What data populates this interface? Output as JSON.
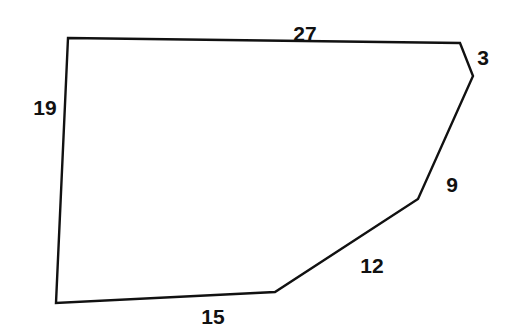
{
  "figure": {
    "name": "labeled-hexagon-perimeter-diagram",
    "background_color": "#ffffff",
    "stroke_color": "#111111",
    "stroke_width": 2.4,
    "fill": "none",
    "vertices": [
      {
        "name": "top-left",
        "x": 68,
        "y": 38
      },
      {
        "name": "top-right",
        "x": 460,
        "y": 43
      },
      {
        "name": "upper-right",
        "x": 473,
        "y": 76
      },
      {
        "name": "mid-right",
        "x": 418,
        "y": 199
      },
      {
        "name": "bottom-right",
        "x": 275,
        "y": 292
      },
      {
        "name": "bottom-left",
        "x": 56,
        "y": 303
      }
    ],
    "edges": [
      {
        "name": "top-edge",
        "label": "27",
        "from": "top-left",
        "to": "top-right",
        "label_x": 305,
        "label_y": 33
      },
      {
        "name": "upper-right-edge",
        "label": "3",
        "from": "top-right",
        "to": "upper-right",
        "label_x": 483,
        "label_y": 57
      },
      {
        "name": "right-diagonal-edge",
        "label": "9",
        "from": "upper-right",
        "to": "mid-right",
        "label_x": 452,
        "label_y": 184
      },
      {
        "name": "lower-diagonal-edge",
        "label": "12",
        "from": "mid-right",
        "to": "bottom-right",
        "label_x": 372,
        "label_y": 265
      },
      {
        "name": "bottom-edge",
        "label": "15",
        "from": "bottom-right",
        "to": "bottom-left",
        "label_x": 213,
        "label_y": 316
      },
      {
        "name": "left-edge",
        "label": "19",
        "from": "bottom-left",
        "to": "top-left",
        "label_x": 45,
        "label_y": 107
      }
    ]
  },
  "chart_data": {
    "type": "diagram",
    "shape": "hexagon",
    "title": "",
    "labels": [
      "27",
      "3",
      "9",
      "12",
      "15",
      "19"
    ],
    "values": [
      27,
      3,
      9,
      12,
      15,
      19
    ],
    "categories": [
      "top-edge",
      "upper-right-edge",
      "right-diagonal-edge",
      "lower-diagonal-edge",
      "bottom-edge",
      "left-edge"
    ],
    "perimeter": 85,
    "units": "",
    "grid": false,
    "legend": "none"
  }
}
